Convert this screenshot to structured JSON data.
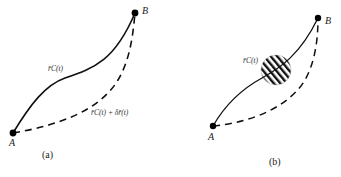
{
  "panels": [
    {
      "id": "a",
      "caption": "(a)",
      "point_start": "A",
      "point_end": "B",
      "solid_curve_label": "r̄C(t)",
      "dashed_curve_label": "r̄C(t) + δr̄(t)"
    },
    {
      "id": "b",
      "caption": "(b)",
      "point_start": "A",
      "point_end": "B",
      "solid_curve_label": "r̄C(t)",
      "hatched_region": "circle"
    }
  ]
}
